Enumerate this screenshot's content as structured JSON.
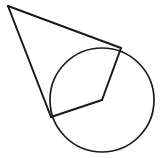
{
  "figure": {
    "kind": "geometry-diagram",
    "background_color": "#ffffff",
    "stroke_color": "#1a1a1a",
    "canvas": {
      "width": 161,
      "height": 158
    }
  },
  "chart_data": {
    "type": "diagram",
    "xlabel": "",
    "ylabel": "",
    "grid": false,
    "legend": false,
    "coordinate_system": "pixel, origin top-left, y increases downward",
    "points": [
      {
        "id": "external-point",
        "label": "",
        "x": 8,
        "y": 6
      },
      {
        "id": "circle-center",
        "label": "",
        "x": 102,
        "y": 100
      },
      {
        "id": "tangent-point-upper-right",
        "label": "",
        "x": 121,
        "y": 48
      },
      {
        "id": "tangent-point-lower-left",
        "label": "",
        "x": 51,
        "y": 117
      }
    ],
    "shapes": [
      {
        "id": "main-circle",
        "type": "circle",
        "cx": 102,
        "cy": 100,
        "r": 52,
        "stroke": "#1a1a1a",
        "stroke_width": 1.7,
        "fill": "none"
      },
      {
        "id": "tangent-segment-upper",
        "type": "line",
        "x1": 8,
        "y1": 6,
        "x2": 121,
        "y2": 48,
        "stroke": "#1a1a1a",
        "stroke_width": 2.0
      },
      {
        "id": "tangent-segment-lower",
        "type": "line",
        "x1": 8,
        "y1": 6,
        "x2": 51,
        "y2": 117,
        "stroke": "#1a1a1a",
        "stroke_width": 2.0
      },
      {
        "id": "radius-to-upper-tangent",
        "type": "line",
        "x1": 121,
        "y1": 48,
        "x2": 102,
        "y2": 100,
        "stroke": "#1a1a1a",
        "stroke_width": 2.0
      },
      {
        "id": "radius-to-lower-tangent",
        "type": "line",
        "x1": 51,
        "y1": 117,
        "x2": 102,
        "y2": 100,
        "stroke": "#1a1a1a",
        "stroke_width": 2.0
      }
    ],
    "annotations": [],
    "tick_labels": [],
    "series": []
  }
}
